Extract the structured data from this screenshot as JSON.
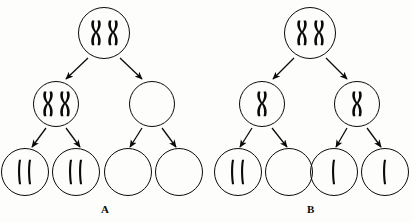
{
  "figure": {
    "width": 412,
    "height": 222,
    "background_color": "#fdfdfc",
    "ink_color": "#0a0a0a"
  },
  "panels": [
    {
      "id": "A",
      "label": "A",
      "label_x": 101,
      "label_y": 203,
      "cells": [
        {
          "name": "panel-a-parent-cell",
          "cx": 104,
          "cy": 33,
          "r": 26,
          "chromosomes": [
            {
              "type": "replicated-x"
            },
            {
              "type": "replicated-x"
            }
          ],
          "count_label": "2"
        },
        {
          "name": "panel-a-daughter-left",
          "cx": 56,
          "cy": 104,
          "r": 23,
          "chromosomes": [
            {
              "type": "replicated-x"
            },
            {
              "type": "replicated-x"
            }
          ],
          "count_label": "2"
        },
        {
          "name": "panel-a-daughter-right",
          "cx": 152,
          "cy": 104,
          "r": 23,
          "chromosomes": [],
          "count_label": "0"
        },
        {
          "name": "panel-a-gamete-1",
          "cx": 25,
          "cy": 172,
          "r": 24,
          "chromosomes": [
            {
              "type": "rod"
            },
            {
              "type": "rod"
            }
          ],
          "count_label": "2"
        },
        {
          "name": "panel-a-gamete-2",
          "cx": 76,
          "cy": 172,
          "r": 24,
          "chromosomes": [
            {
              "type": "rod"
            },
            {
              "type": "rod"
            }
          ],
          "count_label": "2"
        },
        {
          "name": "panel-a-gamete-3",
          "cx": 128,
          "cy": 172,
          "r": 24,
          "chromosomes": [],
          "count_label": "0"
        },
        {
          "name": "panel-a-gamete-4",
          "cx": 179,
          "cy": 172,
          "r": 24,
          "chromosomes": [],
          "count_label": "0"
        }
      ],
      "arrows": [
        {
          "name": "panel-a-arrow-parent-to-left",
          "x1": 88,
          "y1": 58,
          "x2": 66,
          "y2": 79
        },
        {
          "name": "panel-a-arrow-parent-to-right",
          "x1": 120,
          "y1": 58,
          "x2": 142,
          "y2": 79
        },
        {
          "name": "panel-a-arrow-left-to-g1",
          "x1": 46,
          "y1": 128,
          "x2": 32,
          "y2": 147
        },
        {
          "name": "panel-a-arrow-left-to-g2",
          "x1": 66,
          "y1": 128,
          "x2": 80,
          "y2": 147
        },
        {
          "name": "panel-a-arrow-right-to-g3",
          "x1": 142,
          "y1": 128,
          "x2": 130,
          "y2": 147
        },
        {
          "name": "panel-a-arrow-right-to-g4",
          "x1": 162,
          "y1": 128,
          "x2": 176,
          "y2": 147
        }
      ]
    },
    {
      "id": "B",
      "label": "B",
      "label_x": 307,
      "label_y": 203,
      "cells": [
        {
          "name": "panel-b-parent-cell",
          "cx": 310,
          "cy": 33,
          "r": 26,
          "chromosomes": [
            {
              "type": "replicated-x"
            },
            {
              "type": "replicated-x"
            }
          ],
          "count_label": "2"
        },
        {
          "name": "panel-b-daughter-left",
          "cx": 262,
          "cy": 104,
          "r": 23,
          "chromosomes": [
            {
              "type": "replicated-x"
            }
          ],
          "count_label": "1"
        },
        {
          "name": "panel-b-daughter-right",
          "cx": 357,
          "cy": 104,
          "r": 23,
          "chromosomes": [
            {
              "type": "replicated-x"
            }
          ],
          "count_label": "1"
        },
        {
          "name": "panel-b-gamete-1",
          "cx": 238,
          "cy": 172,
          "r": 24,
          "chromosomes": [
            {
              "type": "rod"
            },
            {
              "type": "rod"
            }
          ],
          "count_label": "2"
        },
        {
          "name": "panel-b-gamete-2",
          "cx": 289,
          "cy": 172,
          "r": 24,
          "chromosomes": [],
          "count_label": "0"
        },
        {
          "name": "panel-b-gamete-3",
          "cx": 334,
          "cy": 172,
          "r": 24,
          "chromosomes": [
            {
              "type": "rod"
            }
          ],
          "count_label": "1"
        },
        {
          "name": "panel-b-gamete-4",
          "cx": 385,
          "cy": 172,
          "r": 24,
          "chromosomes": [
            {
              "type": "rod"
            }
          ],
          "count_label": "1"
        }
      ],
      "arrows": [
        {
          "name": "panel-b-arrow-parent-to-left",
          "x1": 294,
          "y1": 58,
          "x2": 273,
          "y2": 79
        },
        {
          "name": "panel-b-arrow-parent-to-right",
          "x1": 326,
          "y1": 58,
          "x2": 347,
          "y2": 79
        },
        {
          "name": "panel-b-arrow-left-to-g1",
          "x1": 252,
          "y1": 128,
          "x2": 240,
          "y2": 147
        },
        {
          "name": "panel-b-arrow-left-to-g2",
          "x1": 272,
          "y1": 128,
          "x2": 287,
          "y2": 147
        },
        {
          "name": "panel-b-arrow-right-to-g3",
          "x1": 347,
          "y1": 128,
          "x2": 336,
          "y2": 147
        },
        {
          "name": "panel-b-arrow-right-to-g4",
          "x1": 367,
          "y1": 128,
          "x2": 381,
          "y2": 147
        }
      ]
    }
  ]
}
